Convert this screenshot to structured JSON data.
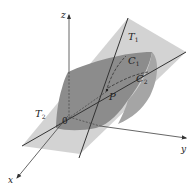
{
  "figure": {
    "colors": {
      "background": "#ffffff",
      "plane": "#c8c8c8",
      "surface": "#8a8a8a",
      "line": "#333333",
      "axis": "#555555"
    },
    "axes": {
      "x": {
        "label": "x"
      },
      "y": {
        "label": "y"
      },
      "z": {
        "label": "z"
      }
    },
    "origin_label": "0",
    "point_label": "P",
    "tangent_lines": [
      {
        "label": "T",
        "subscript": "1"
      },
      {
        "label": "T",
        "subscript": "2"
      }
    ],
    "curves": [
      {
        "label": "C",
        "subscript": "1"
      },
      {
        "label": "C",
        "subscript": "2"
      }
    ]
  }
}
